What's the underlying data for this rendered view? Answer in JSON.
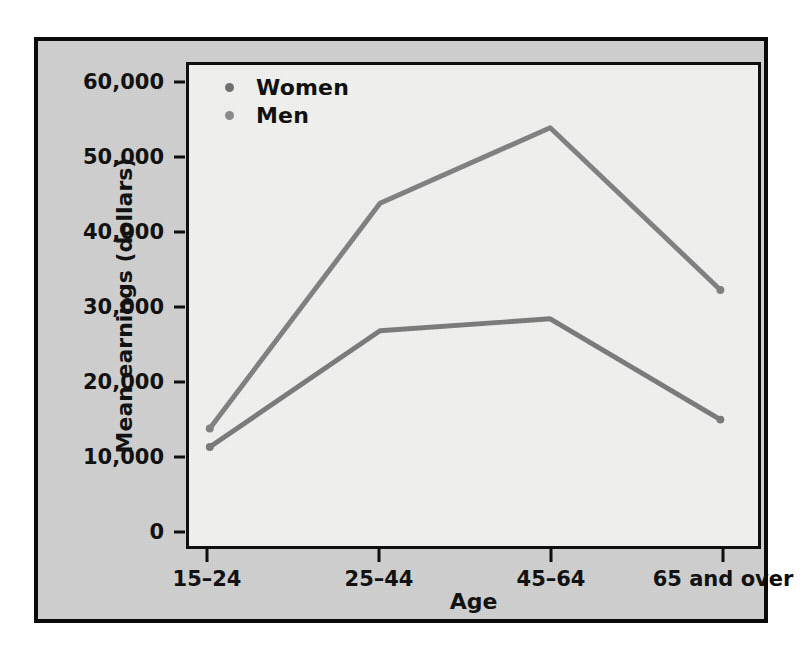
{
  "chart_data": {
    "type": "line",
    "title": "",
    "xlabel": "Age",
    "ylabel": "Mean earnings (dollars)",
    "categories": [
      "15–24",
      "25–44",
      "45–64",
      "65 and over"
    ],
    "series": [
      {
        "name": "Men",
        "color": "#808080",
        "values": [
          13600,
          44000,
          54200,
          32300
        ]
      },
      {
        "name": "Women",
        "color": "#7a7a7a",
        "values": [
          11100,
          26800,
          28400,
          14800
        ]
      }
    ],
    "ylim": [
      0,
      60000
    ],
    "y_ticks": [
      0,
      10000,
      20000,
      30000,
      40000,
      50000,
      60000
    ],
    "y_tick_labels": [
      "0",
      "10,000",
      "20,000",
      "30,000",
      "40,000",
      "50,000",
      "60,000"
    ],
    "grid": false,
    "legend_position": "top-left",
    "legend": [
      {
        "label": "Women",
        "marker": "legend-dot-icon",
        "color": "#6f6f6f"
      },
      {
        "label": "Men",
        "marker": "legend-dot-icon",
        "color": "#8a8a8a"
      }
    ]
  },
  "figure": {
    "panel_background": "#f2f2f0",
    "frame_background": "#d0d0d0",
    "border_color": "#0a0a0a",
    "line_color": "#808080",
    "text_color": "#0d0d0d"
  }
}
